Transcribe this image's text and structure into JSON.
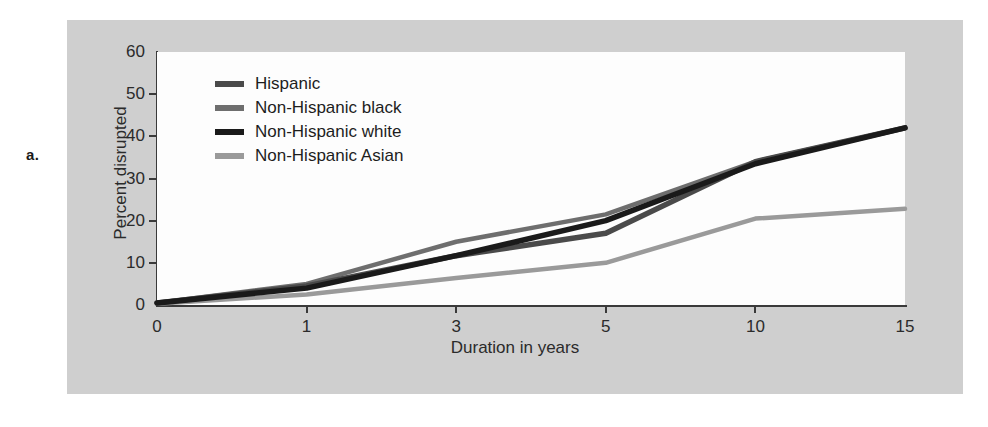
{
  "figure": {
    "panel_label": "a."
  },
  "chart_data": {
    "type": "line",
    "title": "",
    "xlabel": "Duration in years",
    "ylabel": "Percent disrupted",
    "x": [
      0,
      1,
      3,
      5,
      10,
      15
    ],
    "x_tick_labels": [
      "0",
      "1",
      "3",
      "5",
      "10",
      "15"
    ],
    "y_tick_labels": [
      "0",
      "10",
      "20",
      "30",
      "40",
      "50",
      "60"
    ],
    "y_ticks": [
      0,
      10,
      20,
      30,
      40,
      50,
      60
    ],
    "ylim": [
      0,
      60
    ],
    "grid": false,
    "legend_position": "upper-left-inside",
    "axis_scale": "categorical-ordinal",
    "series": [
      {
        "name": "Hispanic",
        "color": "#4a4a4a",
        "values": [
          0.5,
          4.5,
          11.7,
          17.0,
          34.0,
          42.0
        ]
      },
      {
        "name": "Non-Hispanic black",
        "color": "#6e6e6e",
        "values": [
          0.5,
          5.0,
          15.0,
          21.5,
          34.0,
          42.0
        ]
      },
      {
        "name": "Non-Hispanic white",
        "color": "#1a1a1a",
        "values": [
          0.5,
          4.0,
          11.7,
          20.0,
          33.5,
          42.0
        ]
      },
      {
        "name": "Non-Hispanic Asian",
        "color": "#9a9a9a",
        "values": [
          0.3,
          2.5,
          6.4,
          10.0,
          20.5,
          22.8
        ]
      }
    ],
    "series_top": {
      "name": "Non-Hispanic black",
      "color": "#6e6e6e",
      "values": [
        0.5,
        5.0,
        15.0,
        21.5,
        34.0,
        42.0
      ]
    }
  },
  "colors": {
    "panel_background": "#cfcfcf",
    "plot_background": "#fdfdfd",
    "axis": "#3a3a3a",
    "text": "#2b2b2b"
  }
}
